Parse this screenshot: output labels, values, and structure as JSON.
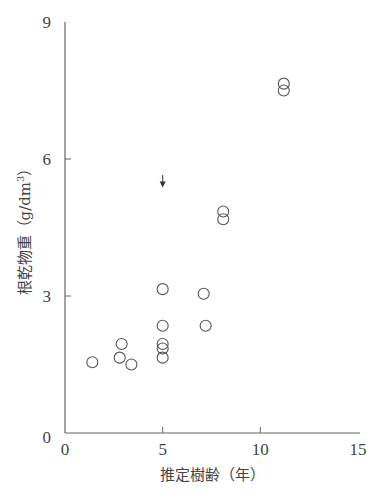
{
  "chart_data": {
    "type": "scatter",
    "title": "",
    "xlabel": "推定樹齢（年）",
    "ylabel": "根乾物重（g/dm³）",
    "xlim": [
      0,
      15
    ],
    "ylim": [
      0,
      9
    ],
    "xticks": [
      0,
      5,
      10,
      15
    ],
    "yticks": [
      0,
      3,
      6,
      9
    ],
    "xtick_labels": [
      "0",
      "5",
      "10",
      "15"
    ],
    "ytick_labels": [
      "0",
      "3",
      "6",
      "9"
    ],
    "grid": false,
    "legend": null,
    "marker": "open-circle",
    "series": [
      {
        "name": "root dry weight",
        "points": [
          {
            "x": 1.4,
            "y": 1.55
          },
          {
            "x": 2.8,
            "y": 1.65
          },
          {
            "x": 2.9,
            "y": 1.95
          },
          {
            "x": 3.4,
            "y": 1.5
          },
          {
            "x": 5.0,
            "y": 1.65
          },
          {
            "x": 5.0,
            "y": 1.85
          },
          {
            "x": 5.0,
            "y": 1.95
          },
          {
            "x": 5.0,
            "y": 2.35
          },
          {
            "x": 5.0,
            "y": 3.15
          },
          {
            "x": 7.1,
            "y": 3.05
          },
          {
            "x": 7.2,
            "y": 2.35
          },
          {
            "x": 8.1,
            "y": 4.85
          },
          {
            "x": 8.1,
            "y": 4.68
          },
          {
            "x": 11.2,
            "y": 7.65
          },
          {
            "x": 11.2,
            "y": 7.5
          }
        ]
      }
    ],
    "annotations": [
      {
        "type": "arrow",
        "x": 5.0,
        "y_from": 5.65,
        "y_to": 5.4,
        "direction": "down"
      }
    ]
  },
  "axes": {
    "x_title": "推定樹齢（年）",
    "y_title_main": "根乾物重（g/dm",
    "y_title_sup": "3",
    "y_title_end": "）"
  }
}
